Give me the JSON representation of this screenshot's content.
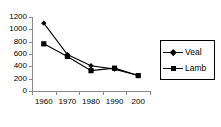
{
  "chart_data": {
    "type": "line",
    "title": "",
    "subtitle": "",
    "xlabel": "",
    "ylabel": "",
    "categories": [
      "1960",
      "1970",
      "1980",
      "1990",
      "200"
    ],
    "series": [
      {
        "name": "Veal",
        "marker": "diamond",
        "color": "#000000",
        "values": [
          1100,
          590,
          410,
          355,
          250
        ]
      },
      {
        "name": "Lamb",
        "marker": "square",
        "color": "#000000",
        "values": [
          765,
          560,
          330,
          370,
          250
        ]
      }
    ],
    "ylim": [
      0,
      1200
    ],
    "yticks": [
      0,
      200,
      400,
      600,
      800,
      1000,
      1200
    ],
    "ytick_labels": [
      "0",
      "200",
      "400",
      "600",
      "800",
      "1000",
      "1200"
    ],
    "grid": false,
    "legend_position": "right",
    "background": "#ffffff",
    "axis_color": "#8a8a8a"
  },
  "legend": {
    "entries": [
      {
        "label": "Veal",
        "marker": "diamond"
      },
      {
        "label": "Lamb",
        "marker": "square"
      }
    ]
  }
}
